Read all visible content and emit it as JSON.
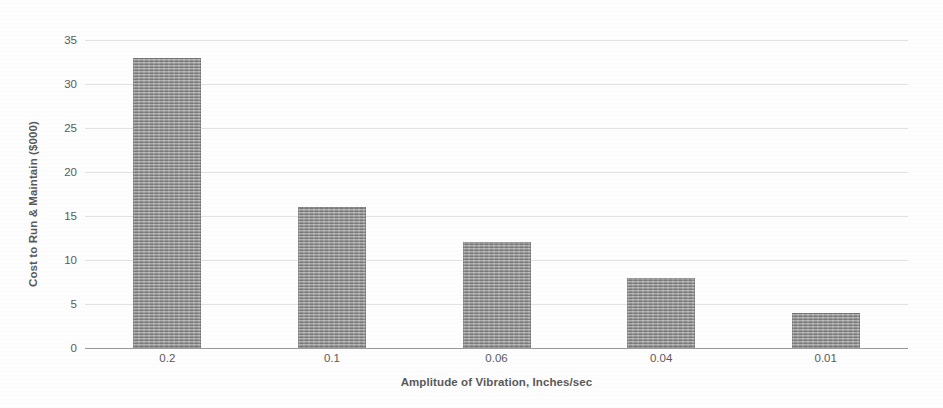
{
  "chart_data": {
    "type": "bar",
    "title": "",
    "xlabel": "Amplitude of Vibration, Inches/sec",
    "ylabel": "Cost to Run & Maintain ($000)",
    "categories": [
      "0.2",
      "0.1",
      "0.06",
      "0.04",
      "0.01"
    ],
    "values": [
      33,
      16,
      12,
      8,
      4
    ],
    "series": [
      {
        "name": "Cost to Run & Maintain",
        "values": [
          33,
          16,
          12,
          8,
          4
        ]
      }
    ],
    "ylim": [
      0,
      35
    ],
    "yticks": [
      "0",
      "5",
      "10",
      "15",
      "20",
      "25",
      "30",
      "35"
    ],
    "ytick_values": [
      0,
      5,
      10,
      15,
      20,
      25,
      30,
      35
    ],
    "grid": true,
    "grid_axis": "y",
    "legend": false,
    "legend_position": "none",
    "bar_color": "#8d8d8d",
    "gridline_color": "#e2e2e2",
    "baseline_color": "#9a9a9a",
    "background_color": "#fdfdfd",
    "text_color": "#5a5a5a",
    "annotations": []
  }
}
